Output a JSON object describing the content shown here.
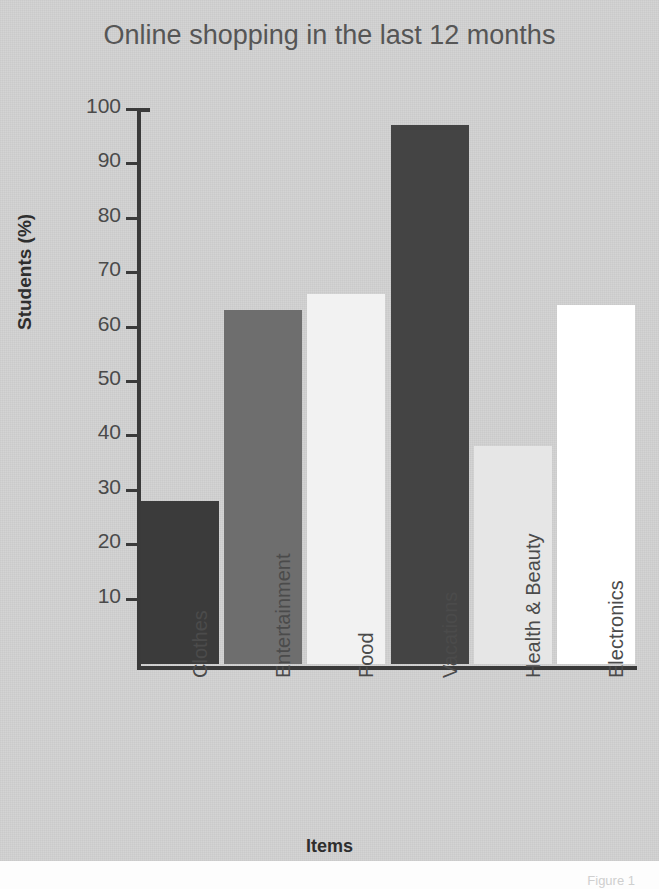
{
  "chart_data": {
    "type": "bar",
    "title": "Online shopping in the last 12 months",
    "xlabel": "Items",
    "ylabel": "Students (%)",
    "categories": [
      "Clothes",
      "Entertainment",
      "Food",
      "Vacations",
      "Health & Beauty",
      "Electronics"
    ],
    "values": [
      30,
      65,
      68,
      99,
      40,
      66
    ],
    "bar_colors": [
      "#3b3b3b",
      "#6e6e6e",
      "#f2f2f2",
      "#444444",
      "#e6e6e6",
      "#ffffff"
    ],
    "ylim": [
      0,
      100
    ],
    "yticks": [
      10,
      20,
      30,
      40,
      50,
      60,
      70,
      80,
      90,
      100
    ],
    "ytick_labels": [
      "10",
      "20",
      "30",
      "40",
      "50",
      "60",
      "70",
      "80",
      "90",
      "100"
    ],
    "grid": false,
    "legend": "none",
    "background_color": "#d2d2d2",
    "axis_color": "#3a3a3a",
    "title_color": "#565656"
  },
  "caption": {
    "text": "Figure 1"
  }
}
